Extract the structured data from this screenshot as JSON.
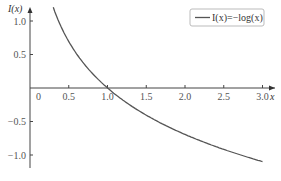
{
  "chart_data": {
    "type": "line",
    "title": "",
    "xlabel": "x",
    "ylabel": "I(x)",
    "xlim": [
      0,
      3.0
    ],
    "ylim": [
      -1.2,
      1.25
    ],
    "x_ticks": [
      "0",
      "0.5",
      "1.0",
      "1.5",
      "2.0",
      "2.5",
      "3.0"
    ],
    "y_ticks": [
      "1.0",
      "0.5",
      "−0.5",
      "−1.0"
    ],
    "grid": false,
    "legend_position": "upper right",
    "series": [
      {
        "name": "I(x)=−log(x)",
        "color": "#555555",
        "x": [
          0.3,
          0.4,
          0.5,
          0.6,
          0.7,
          0.8,
          0.9,
          1.0,
          1.25,
          1.5,
          1.75,
          2.0,
          2.25,
          2.5,
          2.75,
          3.0
        ],
        "values": [
          1.204,
          0.916,
          0.693,
          0.511,
          0.357,
          0.223,
          0.105,
          0.0,
          -0.223,
          -0.405,
          -0.56,
          -0.693,
          -0.811,
          -0.916,
          -1.012,
          -1.099
        ]
      }
    ]
  },
  "legend": {
    "label": "I(x)=−log(x)"
  },
  "axes": {
    "xlabel": "x",
    "ylabel": "I(x)"
  }
}
